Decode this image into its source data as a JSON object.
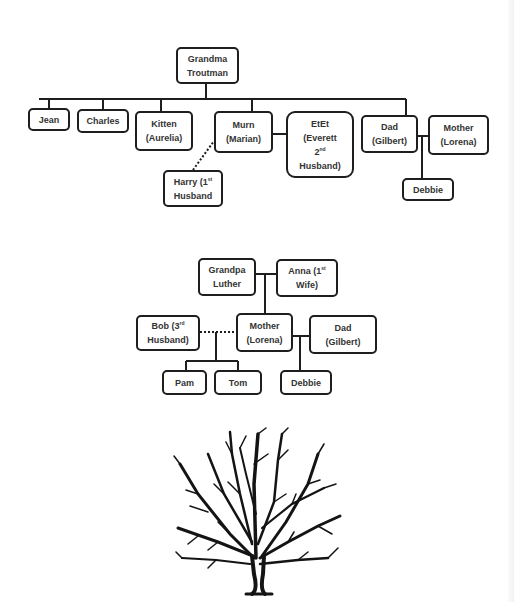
{
  "diagram1": {
    "title": "Troutman family",
    "root": {
      "id": "grandma",
      "label": "Grandma\nTroutman"
    },
    "children": [
      {
        "id": "jean",
        "label": "Jean"
      },
      {
        "id": "charles",
        "label": "Charles"
      },
      {
        "id": "kitten",
        "label": "Kitten\n(Aurelia)"
      },
      {
        "id": "murn",
        "label": "Murn\n(Marian)"
      },
      {
        "id": "dad",
        "label": "Dad\n(Gilbert)"
      }
    ],
    "spouses": [
      {
        "id": "etet",
        "label_main": "EtEt\n(Everett\n2",
        "label_sup": "nd",
        "label_tail": "\nHusband)",
        "partner_of": "murn",
        "line": "solid"
      },
      {
        "id": "harry",
        "label_main": "Harry (1",
        "label_sup": "st",
        "label_tail": "\nHusband",
        "partner_of": "murn",
        "line": "dotted"
      },
      {
        "id": "mother",
        "label": "Mother\n(Lorena)",
        "partner_of": "dad",
        "line": "solid"
      }
    ],
    "grandchildren": [
      {
        "id": "debbie",
        "label": "Debbie",
        "parents": [
          "dad",
          "mother"
        ]
      }
    ]
  },
  "diagram2": {
    "title": "Luther family",
    "grandpa": {
      "id": "grandpa",
      "label": "Grandpa\nLuther"
    },
    "anna": {
      "id": "anna",
      "label_main": "Anna (1",
      "label_sup": "st",
      "label_tail": "\nWife)"
    },
    "mother": {
      "id": "mother2",
      "label": "Mother\n(Lorena)"
    },
    "bob": {
      "id": "bob",
      "label_main": "Bob (3",
      "label_sup": "rd",
      "label_tail": "\nHusband)",
      "line": "dotted"
    },
    "dad": {
      "id": "dad2",
      "label": "Dad\n(Gilbert)",
      "line": "solid"
    },
    "children_with_bob": [
      {
        "id": "pam",
        "label": "Pam"
      },
      {
        "id": "tom",
        "label": "Tom"
      }
    ],
    "children_with_dad": [
      {
        "id": "debbie2",
        "label": "Debbie"
      }
    ]
  },
  "illustration": {
    "icon": "bare-tree-icon",
    "color": "#141414"
  },
  "colors": {
    "line": "#1e1e1e",
    "text": "#333333",
    "background": "#ffffff"
  }
}
